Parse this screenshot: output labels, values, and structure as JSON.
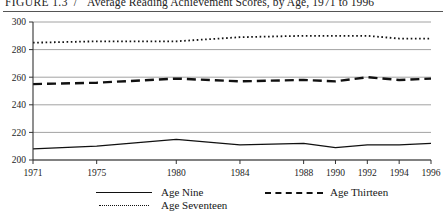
{
  "figure": {
    "label": "FIGURE 1.3",
    "separator": "/",
    "title": "Average Reading Achievement Scores, by Age, 1971 to 1996"
  },
  "legend": {
    "items": [
      {
        "label": "Age Nine",
        "style": "solid"
      },
      {
        "label": "Age Thirteen",
        "style": "dashed"
      },
      {
        "label": "Age Seventeen",
        "style": "dotted"
      }
    ]
  },
  "chart_data": {
    "type": "line",
    "title": "Average Reading Achievement Scores, by Age, 1971 to 1996",
    "xlabel": "",
    "ylabel": "",
    "x": [
      1971,
      1975,
      1980,
      1984,
      1988,
      1990,
      1992,
      1994,
      1996
    ],
    "xticklabels": [
      "1971",
      "1975",
      "1980",
      "1984",
      "1988",
      "1990",
      "1992",
      "1994",
      "1996"
    ],
    "yticks": [
      200,
      220,
      240,
      260,
      280,
      300
    ],
    "yticklabels": [
      "200",
      "220",
      "240",
      "260",
      "280",
      "300"
    ],
    "ylim": [
      200,
      300
    ],
    "xlim": [
      1971,
      1996
    ],
    "grid": true,
    "legend_position": "below",
    "series": [
      {
        "name": "Age Nine",
        "style": "solid",
        "values": [
          208,
          210,
          215,
          211,
          212,
          209,
          211,
          211,
          212
        ]
      },
      {
        "name": "Age Thirteen",
        "style": "dashed",
        "values": [
          255,
          256,
          259,
          257,
          258,
          257,
          260,
          258,
          259
        ]
      },
      {
        "name": "Age Seventeen",
        "style": "dotted",
        "values": [
          285,
          286,
          286,
          289,
          290,
          290,
          290,
          288,
          288
        ]
      }
    ]
  }
}
